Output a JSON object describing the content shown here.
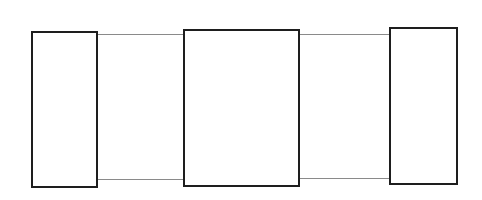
{
  "diagram": {
    "colors": {
      "stroke": "#1e1e1e",
      "connector": "#8a8a8a",
      "background": "#ffffff"
    },
    "boxes": [
      {
        "id": "left",
        "x": 31,
        "y": 31,
        "w": 67,
        "h": 157
      },
      {
        "id": "middle",
        "x": 183,
        "y": 29,
        "w": 117,
        "h": 158
      },
      {
        "id": "right",
        "x": 389,
        "y": 27,
        "w": 69,
        "h": 158
      }
    ],
    "connectors": [
      {
        "id": "left-middle-top",
        "x1": 98,
        "x2": 183,
        "y": 34
      },
      {
        "id": "left-middle-bottom",
        "x1": 98,
        "x2": 183,
        "y": 179
      },
      {
        "id": "middle-right-top",
        "x1": 300,
        "x2": 389,
        "y": 34
      },
      {
        "id": "middle-right-bottom",
        "x1": 300,
        "x2": 389,
        "y": 178
      }
    ]
  }
}
